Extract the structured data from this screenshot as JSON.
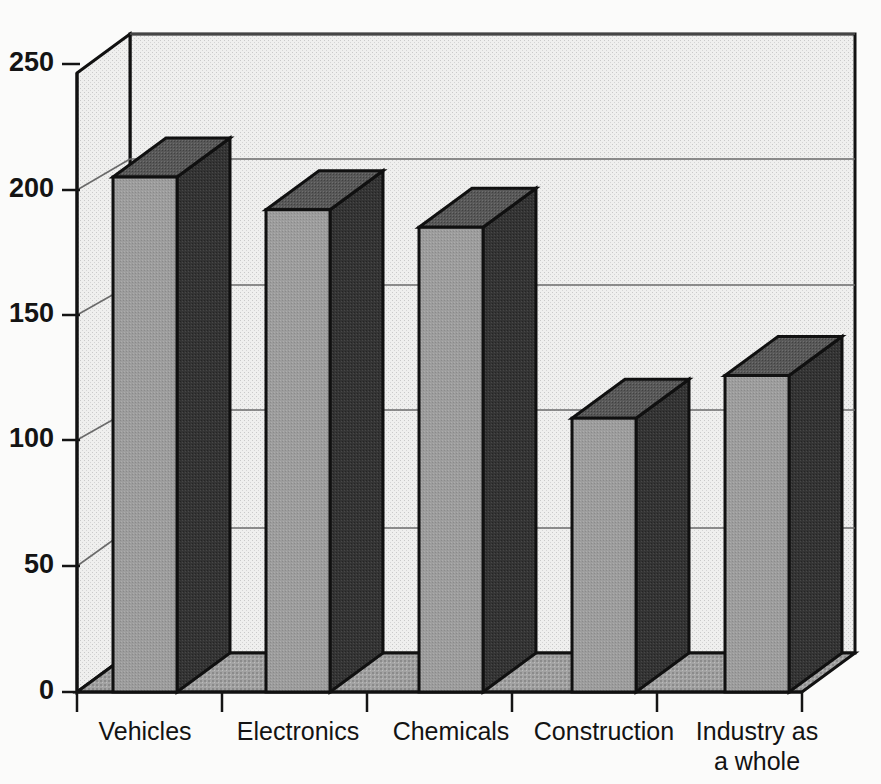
{
  "chart_data": {
    "type": "bar",
    "title": "",
    "subtitle": "",
    "xlabel": "",
    "ylabel": "",
    "categories": [
      "Vehicles",
      "Electronics",
      "Chemicals",
      "Construction",
      "Industry as a whole"
    ],
    "category_lines": [
      [
        "Vehicles"
      ],
      [
        "Electronics"
      ],
      [
        "Chemicals"
      ],
      [
        "Construction"
      ],
      [
        "Industry as",
        "a whole"
      ]
    ],
    "values": [
      205,
      192,
      185,
      109,
      126
    ],
    "series": [
      {
        "name": "",
        "values": [
          205,
          192,
          185,
          109,
          126
        ]
      }
    ],
    "ylim": [
      0,
      260
    ],
    "yticks": [
      0,
      50,
      100,
      150,
      200,
      250
    ],
    "ytick_labels": [
      "0",
      "50",
      "100",
      "150",
      "200",
      "250"
    ],
    "grid": true,
    "gridlines_at": [
      50,
      100,
      150,
      200,
      250
    ],
    "legend": null,
    "legend_position": "none",
    "style": "3d-columns",
    "annotations": []
  },
  "axis": {
    "y_labels": [
      "250",
      "200",
      "150",
      "100",
      "50",
      "0"
    ]
  },
  "colors": {
    "bar_front": "#9a9a9a",
    "bar_side": "#3a3a3a",
    "bar_top": "#5c5c5c",
    "outline": "#101010",
    "wall": "#ececec",
    "floor": "#a8a8a8",
    "gridline": "#555555",
    "background": "#fbfbfa",
    "text": "#131313"
  },
  "geometry": {
    "plot_left": 77,
    "plot_right": 802,
    "baseline_y": 692,
    "top_y": 73,
    "depth_dx": 53,
    "depth_dy": -39,
    "value_per_pixel": 0.3984,
    "bar_width": 64,
    "bar_centers": [
      145,
      298,
      451,
      604,
      757
    ]
  }
}
